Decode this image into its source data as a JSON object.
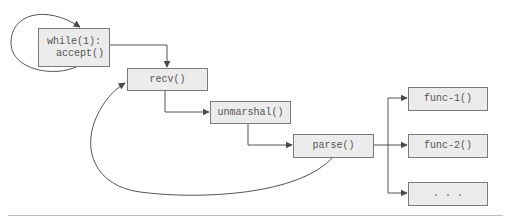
{
  "diagram": {
    "nodes": [
      {
        "id": "accept",
        "lines": [
          "while(1):",
          "  accept()"
        ]
      },
      {
        "id": "recv",
        "label": "recv()"
      },
      {
        "id": "unmarshal",
        "label": "unmarshal()"
      },
      {
        "id": "parse",
        "label": "parse()"
      },
      {
        "id": "func1",
        "label": "func-1()"
      },
      {
        "id": "func2",
        "label": "func-2()"
      },
      {
        "id": "more",
        "label": ". . ."
      }
    ],
    "edges": [
      {
        "from": "accept",
        "to": "accept",
        "type": "self-loop"
      },
      {
        "from": "accept",
        "to": "recv",
        "type": "elbow"
      },
      {
        "from": "recv",
        "to": "unmarshal",
        "type": "elbow"
      },
      {
        "from": "unmarshal",
        "to": "parse",
        "type": "elbow"
      },
      {
        "from": "parse",
        "to": "func1",
        "type": "branch"
      },
      {
        "from": "parse",
        "to": "func2",
        "type": "branch"
      },
      {
        "from": "parse",
        "to": "more",
        "type": "branch"
      },
      {
        "from": "parse",
        "to": "recv",
        "type": "loop-back"
      }
    ],
    "colors": {
      "box_fill": "#ececec",
      "box_border": "#7a7a7a",
      "text": "#555555",
      "line": "#555555",
      "rule": "#bdbdbd"
    }
  }
}
